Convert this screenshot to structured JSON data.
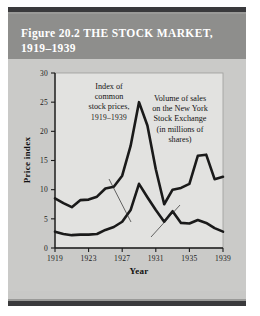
{
  "figure": {
    "title_line1": "Figure 20.2  THE STOCK MARKET,",
    "title_line2": "1919–1939",
    "header_bg": "#8e8e8c",
    "rule_color": "#3a3a3c",
    "body_bg": "#cacac8",
    "plot_bg": "#e2e2e0"
  },
  "chart_data": {
    "type": "line",
    "title": "Figure 20.2  THE STOCK MARKET, 1919–1939",
    "xlabel": "Year",
    "ylabel": "Price index",
    "xlim": [
      1919,
      1939
    ],
    "ylim": [
      0,
      30
    ],
    "grid": false,
    "legend": "annotations",
    "x_ticks": [
      "1919",
      "1923",
      "1927",
      "1931",
      "1935",
      "1939"
    ],
    "x_tick_values": [
      1919,
      1923,
      1927,
      1931,
      1935,
      1939
    ],
    "y_ticks": [
      "0",
      "5",
      "10",
      "15",
      "20",
      "25",
      "30"
    ],
    "y_tick_values": [
      0,
      5,
      10,
      15,
      20,
      25,
      30
    ],
    "x": [
      1919,
      1920,
      1921,
      1922,
      1923,
      1924,
      1925,
      1926,
      1927,
      1928,
      1929,
      1930,
      1931,
      1932,
      1933,
      1934,
      1935,
      1936,
      1937,
      1938,
      1939
    ],
    "series": [
      {
        "name": "Index of common stock prices, 1919–1939",
        "values": [
          8.5,
          7.7,
          7.0,
          8.2,
          8.3,
          8.8,
          10.2,
          10.5,
          12.4,
          17.5,
          25.0,
          21.0,
          13.5,
          7.5,
          10.0,
          10.3,
          11.0,
          15.8,
          16.0,
          11.8,
          12.2
        ],
        "color": "#1a1a1a",
        "width": 2.6
      },
      {
        "name": "Volume of sales on the New York Stock Exchange (in millions of shares)",
        "values": [
          2.8,
          2.4,
          2.2,
          2.3,
          2.3,
          2.4,
          3.1,
          3.6,
          4.5,
          6.5,
          11.0,
          8.7,
          6.5,
          4.5,
          6.3,
          4.3,
          4.2,
          4.8,
          4.3,
          3.4,
          2.8
        ],
        "color": "#1a1a1a",
        "width": 2.6
      }
    ],
    "annotations": [
      {
        "id": "price-index-annotation",
        "lines": [
          "Index of",
          "common",
          "stock prices,",
          "1919–1939"
        ],
        "leader_from": [
          101,
          120
        ],
        "leader_to": [
          123,
          163
        ]
      },
      {
        "id": "volume-annotation",
        "lines": [
          "Volume of sales",
          "on the New York",
          "Stock Exchange",
          "(in millions of",
          "shares)"
        ],
        "leader_from": [
          172,
          146
        ],
        "leader_to": [
          143,
          178
        ]
      }
    ]
  }
}
